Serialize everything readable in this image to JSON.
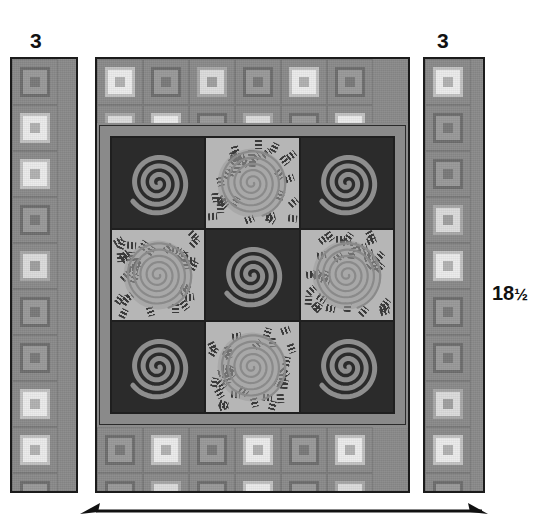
{
  "diagram": {
    "type": "quilt-construction-diagram",
    "labels": {
      "left_border_width": "3",
      "right_border_width": "3",
      "quilt_height": "18",
      "quilt_height_fraction": "½",
      "bottom_arrow": "width-dimension-arrow"
    },
    "colors": {
      "dark_block": "#2b2b2b",
      "light_block": "#b6b6b6",
      "sashing": "#8a8a8a",
      "border_print_base": "#8b8b8b",
      "border_print_light": "#dcdcdc",
      "outline": "#1b1b1b",
      "spiral_on_dark": "#8e8e8e",
      "spiral_on_light": "#8a8a8a",
      "label_text": "#111111",
      "page_background": "#ffffff"
    },
    "center_panel": {
      "name": "quilt-center-panel",
      "rows": 3,
      "columns": 3,
      "blocks": [
        {
          "position": "top-left",
          "fabric": "dark",
          "motif": "spiral"
        },
        {
          "position": "top-center",
          "fabric": "light",
          "motif": "spiral"
        },
        {
          "position": "top-right",
          "fabric": "dark",
          "motif": "spiral"
        },
        {
          "position": "middle-left",
          "fabric": "light",
          "motif": "spiral"
        },
        {
          "position": "middle-center",
          "fabric": "dark",
          "motif": "spiral"
        },
        {
          "position": "middle-right",
          "fabric": "light",
          "motif": "spiral"
        },
        {
          "position": "bottom-left",
          "fabric": "dark",
          "motif": "spiral"
        },
        {
          "position": "bottom-center",
          "fabric": "light",
          "motif": "spiral"
        },
        {
          "position": "bottom-right",
          "fabric": "dark",
          "motif": "spiral"
        }
      ]
    },
    "borders": [
      {
        "name": "left-border-strip",
        "fabric": "square-in-square-print",
        "width_label": "3"
      },
      {
        "name": "right-border-strip",
        "fabric": "square-in-square-print",
        "width_label": "3"
      },
      {
        "name": "top-border-band",
        "fabric": "square-in-square-print"
      },
      {
        "name": "bottom-border-band",
        "fabric": "square-in-square-print"
      }
    ]
  }
}
